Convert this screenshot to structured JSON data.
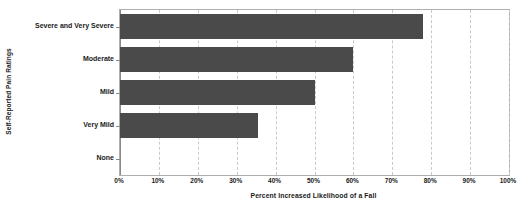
{
  "chart_data": {
    "type": "bar",
    "orientation": "horizontal",
    "title": "",
    "xlabel": "Percent Increased Likelihood of a Fall",
    "ylabel": "Self-Reported Pain Ratings",
    "categories": [
      "Severe and Very Severe",
      "Moderate",
      "Mild",
      "Very Mild",
      "None"
    ],
    "values": [
      78,
      60,
      50,
      35.5,
      0
    ],
    "xlim": [
      0,
      100
    ],
    "xticks": [
      0,
      10,
      20,
      30,
      40,
      50,
      60,
      70,
      80,
      90,
      100
    ],
    "xtick_labels": [
      "0%",
      "10%",
      "20%",
      "30%",
      "40%",
      "50%",
      "60%",
      "70%",
      "80%",
      "90%",
      "100%"
    ],
    "grid": "vertical-dashed",
    "legend": "none",
    "bar_color": "#4a4a4a",
    "grid_color": "#c9c9c9",
    "axis_color": "#8a8a8a",
    "frame_color": "#aeaeae",
    "background": "#ffffff"
  }
}
